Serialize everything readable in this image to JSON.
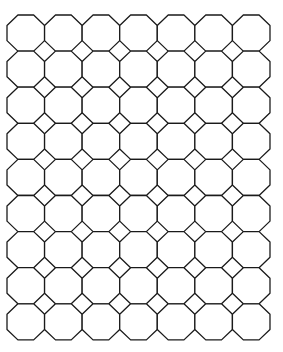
{
  "diagram": {
    "type": "tiling",
    "name": "truncated square tiling (octagons and squares)",
    "columns": 7,
    "rows": 9,
    "origin": {
      "x": 7,
      "y": 15
    },
    "cell": {
      "width": 37.57,
      "height": 36.1
    },
    "corner_ratio": 0.29,
    "stroke_color": "#1a1a1a",
    "fill_color": "#ffffff",
    "background": "#ffffff",
    "stroke_width": 1.3
  }
}
